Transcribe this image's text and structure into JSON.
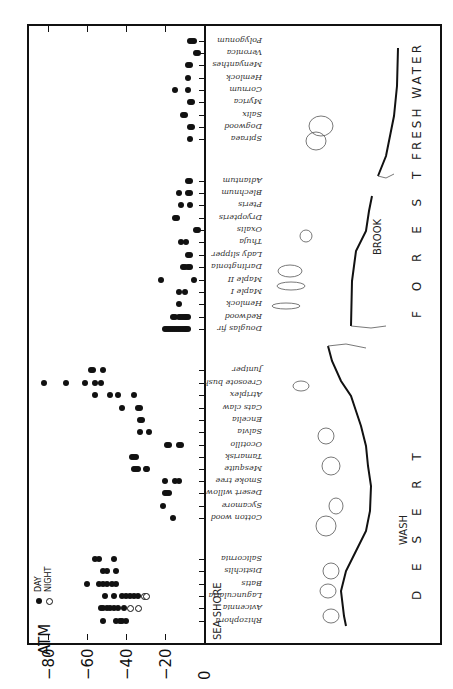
{
  "chart_data": {
    "type": "scatter",
    "orientation": "rotated 90 degrees (x-axis along bottom edge reading left as more negative)",
    "title": "",
    "xlabel": "ATM",
    "ylabel": "",
    "x_ticks": [
      "-80",
      "-60",
      "-40",
      "-20",
      "0"
    ],
    "xlim": [
      -90,
      0
    ],
    "grid": false,
    "legend": [
      {
        "symbol": "filled",
        "label": "DAY"
      },
      {
        "symbol": "open",
        "label": "NIGHT"
      }
    ],
    "regions": [
      "SEA SHORE",
      "WASH",
      "D E S E R T",
      "BROOK",
      "F O R E S T",
      "FRESH WATER"
    ],
    "groups": [
      {
        "region": "Fresh Water",
        "species": [
          {
            "name": "Polygonum",
            "day": [
              -5,
              -6,
              -7
            ]
          },
          {
            "name": "Veronica",
            "day": [
              -3,
              -4
            ]
          },
          {
            "name": "Menyanthes",
            "day": [
              -7,
              -8
            ]
          },
          {
            "name": "Hemlock",
            "day": [
              -8
            ]
          },
          {
            "name": "Cornum",
            "day": [
              -15,
              -8
            ]
          },
          {
            "name": "Myrica",
            "day": [
              -6,
              -7
            ]
          },
          {
            "name": "Salix",
            "day": [
              -10,
              -11
            ]
          },
          {
            "name": "Dogwood",
            "day": [
              -6,
              -7
            ]
          },
          {
            "name": "Spiraea",
            "day": [
              -7
            ]
          }
        ]
      },
      {
        "region": "Forest / Brook",
        "species": [
          {
            "name": "Adiantum",
            "day": [
              -7,
              -8
            ]
          },
          {
            "name": "Blechnum",
            "day": [
              -13,
              -7,
              -8
            ]
          },
          {
            "name": "Pteris",
            "day": [
              -12,
              -7
            ]
          },
          {
            "name": "Dryopteris",
            "day": [
              -15,
              -14
            ]
          },
          {
            "name": "Oxalis",
            "day": [
              -3,
              -4
            ]
          },
          {
            "name": "Thuja",
            "day": [
              -12,
              -9
            ]
          },
          {
            "name": "Lady slipper",
            "day": [
              -8,
              -7
            ]
          },
          {
            "name": "Darlingtonia",
            "day": [
              -11,
              -10,
              -8,
              -7
            ]
          },
          {
            "name": "Maple II",
            "day": [
              -22,
              -5
            ]
          },
          {
            "name": "Maple I",
            "day": [
              -13,
              -10
            ]
          },
          {
            "name": "Hemlock",
            "day": [
              -13
            ]
          },
          {
            "name": "Redwood",
            "day": [
              -16,
              -15,
              -13,
              -12,
              -11,
              -10,
              -9,
              -8
            ]
          },
          {
            "name": "Douglas fir",
            "day": [
              -20,
              -19,
              -18,
              -17,
              -16,
              -15,
              -14,
              -13,
              -12,
              -11,
              -10,
              -9,
              -8
            ]
          }
        ]
      },
      {
        "region": "Desert / Wash",
        "species": [
          {
            "name": "Juniper",
            "day": [
              -58,
              -57,
              -52
            ]
          },
          {
            "name": "Creosote bush",
            "day": [
              -82,
              -71,
              -61,
              -56,
              -53
            ]
          },
          {
            "name": "Atriplex",
            "day": [
              -56,
              -48,
              -44,
              -36
            ]
          },
          {
            "name": "Cats claw",
            "day": [
              -42,
              -34,
              -33
            ]
          },
          {
            "name": "Encelia",
            "day": [
              -33,
              -32
            ]
          },
          {
            "name": "Salvia",
            "day": [
              -33,
              -28
            ]
          },
          {
            "name": "Ocotillo",
            "day": [
              -19,
              -18,
              -13,
              -12
            ]
          },
          {
            "name": "Tamarisk",
            "day": [
              -37,
              -36,
              -35
            ]
          },
          {
            "name": "Mesquite",
            "day": [
              -36,
              -35,
              -34,
              -30,
              -29
            ]
          },
          {
            "name": "Smoke tree",
            "day": [
              -20,
              -15,
              -13
            ]
          },
          {
            "name": "Desert willow",
            "day": [
              -20,
              -19,
              -18
            ]
          },
          {
            "name": "Sycamore",
            "day": [
              -21
            ]
          },
          {
            "name": "Cotton wood",
            "day": [
              -16
            ]
          }
        ]
      },
      {
        "region": "Sea Shore",
        "species": [
          {
            "name": "Salicornia",
            "day": [
              -56,
              -54,
              -46
            ]
          },
          {
            "name": "Distichlis",
            "day": [
              -52,
              -50,
              -45
            ]
          },
          {
            "name": "Batis",
            "day": [
              -60,
              -54,
              -52,
              -50,
              -47,
              -45
            ]
          },
          {
            "name": "Laguncularia",
            "day": [
              -51,
              -46,
              -42,
              -40,
              -38,
              -36,
              -34
            ],
            "night": [
              -31,
              -30
            ]
          },
          {
            "name": "Avicennia",
            "day": [
              -53,
              -52,
              -50,
              -48,
              -46,
              -44,
              -41
            ],
            "night": [
              -38,
              -34
            ]
          },
          {
            "name": "Rhizophora",
            "day": [
              -52,
              -45,
              -43,
              -42,
              -40
            ]
          }
        ]
      }
    ]
  },
  "labels": {
    "axis_title": "ATM",
    "ticks": [
      "-80",
      "-60",
      "-40",
      "-20",
      "0"
    ],
    "legend_day": "DAY",
    "legend_night": "NIGHT",
    "region_seashore": "SEA SHORE",
    "region_wash": "WASH",
    "region_desert": "D E S E R T",
    "region_brook": "BROOK",
    "region_forest": "F O R E S T",
    "region_freshwater": "FRESH WATER"
  }
}
